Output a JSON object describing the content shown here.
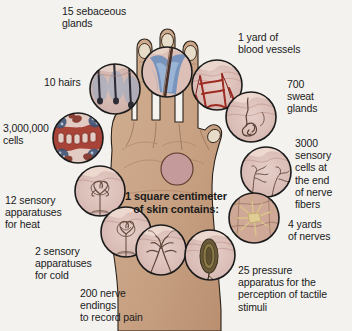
{
  "figure": {
    "title": "1 square centimeter of skin contains",
    "background_color": "#f3f2ef",
    "skin_color": "#c9a586",
    "outline_color": "#2a2118"
  },
  "center": {
    "note_line1": "1 square centimeter",
    "note_line2": "of skin contains:",
    "note": "1 square centimeter\nof skin contains:"
  },
  "labels": {
    "sebaceous_glands": "15 sebaceous\nglands",
    "blood_vessels": "1 yard of\nblood vessels",
    "hairs": "10 hairs",
    "sweat_glands": "700\nsweat\nglands",
    "cells": "3,000,000\ncells",
    "sensory_cells": "3000\nsensory\ncells at\nthe end\nof nerve\nfibers",
    "heat_apparatuses": "12 sensory\napparatuses\nfor heat",
    "nerves": "4 yards\nof nerves",
    "cold_apparatuses": "2 sensory\napparatuses\nfor cold",
    "pressure_apparatus": "25 pressure\napparatus for the\nperception of tactile\nstimuli",
    "nerve_endings": "200 nerve\nendings\nto record pain"
  },
  "callouts": [
    {
      "id": "sebaceous-glands",
      "label": "15 sebaceous glands",
      "value": 15,
      "unit": "glands",
      "cx": 167,
      "cy": 72,
      "r": 25
    },
    {
      "id": "blood-vessels",
      "label": "1 yard of blood vessels",
      "value": 1,
      "unit": "yard",
      "cx": 217,
      "cy": 85,
      "r": 25
    },
    {
      "id": "hairs",
      "label": "10 hairs",
      "value": 10,
      "unit": "hairs",
      "cx": 115,
      "cy": 89,
      "r": 25
    },
    {
      "id": "sweat-glands",
      "label": "700 sweat glands",
      "value": 700,
      "unit": "glands",
      "cx": 251,
      "cy": 117,
      "r": 25
    },
    {
      "id": "cells",
      "label": "3,000,000 cells",
      "value": 3000000,
      "unit": "cells",
      "cx": 78,
      "cy": 138,
      "r": 25
    },
    {
      "id": "sensory-cells",
      "label": "3000 sensory cells at the end of nerve fibers",
      "value": 3000,
      "unit": "cells",
      "cx": 266,
      "cy": 172,
      "r": 25
    },
    {
      "id": "heat-apparatuses",
      "label": "12 sensory apparatuses for heat",
      "value": 12,
      "unit": "apparatuses",
      "cx": 100,
      "cy": 191,
      "r": 25
    },
    {
      "id": "nerves",
      "label": "4 yards of nerves",
      "value": 4,
      "unit": "yards",
      "cx": 254,
      "cy": 218,
      "r": 25
    },
    {
      "id": "cold-apparatuses",
      "label": "2 sensory apparatuses for cold",
      "value": 2,
      "unit": "apparatuses",
      "cx": 126,
      "cy": 232,
      "r": 25
    },
    {
      "id": "pressure-apparatus",
      "label": "25 pressure apparatus for the perception of tactile stimuli",
      "value": 25,
      "unit": "apparatus",
      "cx": 210,
      "cy": 255,
      "r": 25
    },
    {
      "id": "nerve-endings",
      "label": "200 nerve endings to record pain",
      "value": 200,
      "unit": "nerve endings",
      "cx": 161,
      "cy": 250,
      "r": 25
    }
  ]
}
